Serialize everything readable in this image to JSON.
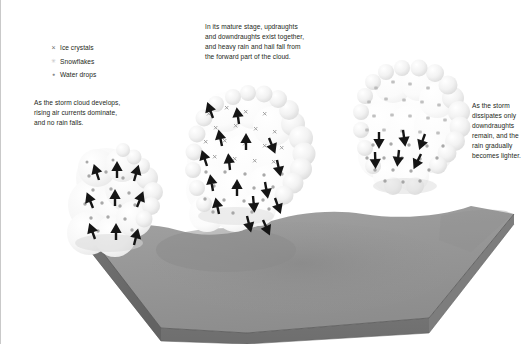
{
  "figure": {
    "width": 532,
    "height": 344,
    "background": "#ffffff",
    "border_color": "#c9c9c9"
  },
  "legend": {
    "items": [
      {
        "symbol_name": "ice-crystal-icon",
        "symbol_glyph": "×",
        "label": "Ice crystals",
        "color": "#6e6e6e"
      },
      {
        "symbol_name": "snowflake-icon",
        "symbol_glyph": "✳",
        "label": "Snowflakes",
        "color": "#c4c4c4"
      },
      {
        "symbol_name": "water-drop-icon",
        "symbol_glyph": "●",
        "label": "Water drops",
        "color": "#8a8a8a"
      }
    ]
  },
  "captions": {
    "developing": "As the storm cloud develops,\nrising air currents dominate,\nand no rain falls.",
    "mature": "In its mature stage, updraughts\nand downdraughts exist together,\nand heavy rain and hail fall from\nthe forward part of the cloud.",
    "dissipating": "As the storm\ndissipates only\ndowndraughts\nremain, and the\nrain gradually\nbecomes lighter."
  },
  "scene": {
    "ground": {
      "top_face_color": "#9a9a9a",
      "top_face_color_dark": "#8b8b8b",
      "front_face_color": "#767676",
      "left_face_color": "#6b6b6b",
      "edge_color": "#5f5f5f"
    },
    "clouds": [
      {
        "stage": "developing",
        "name": "cloud-developing",
        "fill": "#f4f4f4",
        "particles": "water drops",
        "arrows": "updraughts only"
      },
      {
        "stage": "mature",
        "name": "cloud-mature",
        "fill": "#fbfbfb",
        "particles": "ice crystals, snowflakes, water drops",
        "arrows": "updraughts and downdraughts"
      },
      {
        "stage": "dissipating",
        "name": "cloud-dissipating",
        "fill": "#fafafa",
        "particles": "snowflakes, water drops",
        "arrows": "downdraughts only"
      }
    ],
    "arrow_color": "#151515"
  }
}
